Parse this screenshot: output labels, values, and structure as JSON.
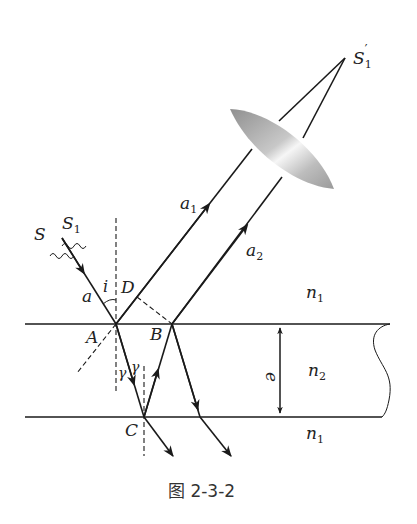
{
  "figure": {
    "caption": "图 2-3-2",
    "labels": {
      "source_S": "S",
      "source_S1": "S",
      "source_S1_sub": "1",
      "image_S1prime": "S",
      "image_S1prime_sub": "1",
      "image_S1prime_mark": "′",
      "ray_a": "a",
      "ray_a1": "a",
      "ray_a1_sub": "1",
      "ray_a2": "a",
      "ray_a2_sub": "2",
      "angle_i": "i",
      "angle_gamma1": "γ",
      "angle_gamma2": "γ",
      "point_A": "A",
      "point_B": "B",
      "point_C": "C",
      "point_D": "D",
      "thickness_e": "e",
      "medium_top": "n",
      "medium_top_sub": "1",
      "medium_slab": "n",
      "medium_slab_sub": "2",
      "medium_bottom": "n",
      "medium_bottom_sub": "1"
    },
    "points": {
      "A": [
        116,
        324
      ],
      "B": [
        172,
        324
      ],
      "C": [
        144,
        417
      ],
      "D": [
        137,
        297
      ],
      "S1_prime": [
        345,
        58
      ]
    },
    "colors": {
      "line": "#1a1a1a",
      "lens_dark": "#9a9a9a",
      "lens_light": "#f4f4f4",
      "background": "#ffffff"
    }
  }
}
